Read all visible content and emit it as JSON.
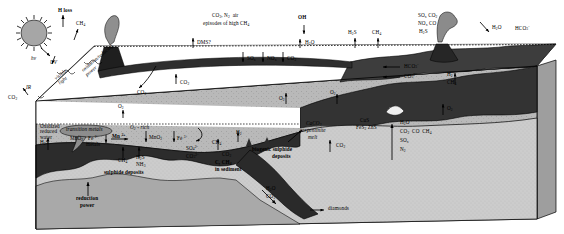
{
  "figure": {
    "colors": {
      "ocean": "#3a3a3a",
      "crust": "#b7b7b7",
      "mantle": "#8e8e8e",
      "sun": "#9a9a9a",
      "volcano": "#2b2b2b",
      "line": "#000000",
      "sediment": "#cfcfcf",
      "deep_dark": "#242424"
    }
  },
  "atmosphere": {
    "sun_label": "",
    "h_loss": "H loss",
    "ch4_up": "CH4",
    "hv": "hv",
    "uv": "UV",
    "visible_light": "visible light",
    "oxidation_reducing_power": "oxidation/reducing power",
    "ir": "IR",
    "co2_out": "CO2",
    "air_composition": "CO2, N2 air",
    "air_episodes": "episodes of high CH4",
    "oh": "OH",
    "dms": "DMS?",
    "h2o_atm": "H2O",
    "h2s_atm": "H2S",
    "ch4_atm": "CH4",
    "volcanic_sox_co2": "SOx CO2",
    "volcanic_nox_co": "NOx CO",
    "volcanic_h2s": "H2S",
    "h2o_right": "H2O",
    "hco3_right": "HCO3-"
  },
  "ocean": {
    "sox_down": "SOx",
    "nox_down": "NOx",
    "co2_down": "CO2",
    "co2_up_left": "CO2",
    "co2_curl": "CO2",
    "o2_left": "O2",
    "o2_mid": "O2",
    "o2_right": "O2",
    "hco3_in": "HCO3-",
    "co3_in": "CO3 2-",
    "h2_vent": "H2",
    "ch4_vent": "CH4",
    "o2_vent": "O2",
    "oxidized_reduced_water": "Oxidized/\nreduced\nwater",
    "o2_surface": "O2",
    "o2_rich": "O2 - rich",
    "transition_metals": "transition metals"
  },
  "seafloor": {
    "h2s_left": "H2S",
    "mno2_left": "MnO2",
    "fe2_metals_a": "Fe 2+",
    "fe2_metals_b": "metals",
    "mn2": "Mn 2+",
    "mno2_mid": "MnO2",
    "fe3": "Fe 3+",
    "ch4_floor": "CH4",
    "h2s_floor": "H2S",
    "nh3_floor": "NH3",
    "so4_floor": "SO4 2-",
    "co3_floor": "CO3 2-",
    "sulphide_deposits": "sulphide deposits",
    "ch4_sed": "CH4",
    "h2_sed": "H2",
    "co2_sed": "CO2",
    "c_ch4_sediment_a": "C, CH4",
    "c_ch4_sediment_b": "in sediment",
    "biogenic_sulphide_a": "biogenic sulphide",
    "biogenic_sulphide_b": "deposits",
    "cus_fes2_zns": "CuS FeS2 ZnS",
    "caco3_serpentinite_a": "CaCO3",
    "caco3_serpentinite_b": "serpentinite",
    "caco3_serpentinite_c": "melt",
    "co2_subduct": "CO2"
  },
  "mantle": {
    "h2o": "H2O",
    "co2_co_ch4": "CO2  CO  CH4",
    "sox": "SOx",
    "n2": "N2",
    "reduction_power_a": "reduction",
    "reduction_power_b": "power",
    "h2o_deep": "H2O",
    "co2_deep": "CO2",
    "diamonds": "diamonds"
  }
}
